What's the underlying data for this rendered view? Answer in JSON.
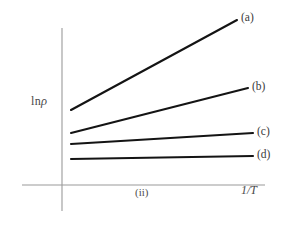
{
  "figure": {
    "background_color": "#ffffff",
    "axis_color": "#9a9a9a",
    "curve_color": "#141414",
    "panel_label": "(ii)",
    "y_axis_label_prefix": "ln",
    "y_axis_label_symbol": "ρ",
    "x_axis_label": "1/T"
  },
  "chart_data": {
    "type": "line",
    "title": "",
    "subtitle": "",
    "xlabel": "1/T",
    "ylabel": "ln ρ",
    "annotations": [
      "(ii)"
    ],
    "grid": false,
    "legend_position": "right-end-of-line",
    "axis_style": "bare-axes-no-ticks",
    "xlim": [
      0,
      1
    ],
    "ylim": [
      0,
      1
    ],
    "x": [
      0.05,
      0.78
    ],
    "series": [
      {
        "name": "(a)",
        "label": "(a)",
        "values": [
          0.41,
          0.89
        ],
        "slope": "steepest",
        "color": "#141414"
      },
      {
        "name": "(b)",
        "label": "(b)",
        "values": [
          0.27,
          0.54
        ],
        "slope": "moderate",
        "color": "#141414"
      },
      {
        "name": "(c)",
        "label": "(c)",
        "values": [
          0.21,
          0.26
        ],
        "slope": "slight",
        "color": "#141414"
      },
      {
        "name": "(d)",
        "label": "(d)",
        "values": [
          0.115,
          0.135
        ],
        "slope": "nearly-flat",
        "color": "#141414"
      }
    ]
  },
  "geometry": {
    "x_axis": {
      "x1": 22,
      "y1": 185,
      "x2": 265,
      "y2": 185
    },
    "y_axis": {
      "x1": 62,
      "y1": 28,
      "x2": 62,
      "y2": 211
    },
    "lines": [
      {
        "key": "a",
        "x1": 71,
        "y1": 110,
        "x2": 237,
        "y2": 20
      },
      {
        "key": "b",
        "x1": 71,
        "y1": 133,
        "x2": 248,
        "y2": 88
      },
      {
        "key": "c",
        "x1": 71,
        "y1": 144,
        "x2": 253,
        "y2": 133
      },
      {
        "key": "d",
        "x1": 71,
        "y1": 159,
        "x2": 253,
        "y2": 156
      }
    ]
  }
}
